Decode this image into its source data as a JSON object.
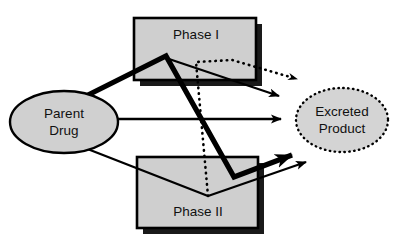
{
  "diagram": {
    "type": "flow-diagram",
    "background_color": "#ffffff",
    "nodes": {
      "parent_drug": {
        "label_line1": "Parent",
        "label_line2": "Drug",
        "shape": "ellipse",
        "fill": "#d0d0d0",
        "border_style": "solid",
        "border_color": "#000000",
        "cx": 64,
        "cy": 122,
        "rx": 54,
        "ry": 31
      },
      "excreted_product": {
        "label_line1": "Excreted",
        "label_line2": "Product",
        "shape": "ellipse",
        "fill": "#d4d4d4",
        "border_style": "dotted",
        "border_color": "#000000",
        "cx": 342,
        "cy": 120,
        "rx": 46,
        "ry": 32
      },
      "phase_one": {
        "label": "Phase I",
        "shape": "rectangle",
        "fill": "#cfcfcf",
        "border_style": "solid",
        "border_color": "#000000",
        "shadow": true,
        "x": 134,
        "y": 18,
        "width": 122,
        "height": 62
      },
      "phase_two": {
        "label": "Phase II",
        "shape": "rectangle",
        "fill": "#cfcfcf",
        "border_style": "solid",
        "border_color": "#000000",
        "shadow": true,
        "x": 137,
        "y": 157,
        "width": 121,
        "height": 71
      }
    },
    "edges": {
      "parent_to_phase1_thick": {
        "name": "parent-drug-to-phase-one",
        "style": "thick-solid",
        "stroke_width": 5,
        "color": "#000000",
        "points": "82,98 165,57"
      },
      "phase1_thick_descent": {
        "name": "phase-one-thick-descent-to-excreted",
        "style": "thick-solid",
        "stroke_width": 5,
        "color": "#000000",
        "points": "165,57 234,177 298,153",
        "arrowhead": "thick-filled"
      },
      "phase1_thin_to_excreted": {
        "name": "phase-one-to-excreted-thin",
        "style": "thin-solid",
        "stroke_width": 2,
        "color": "#000000",
        "points": "166,58 281,97",
        "arrowhead": "thin-filled"
      },
      "parent_direct_to_excreted": {
        "name": "parent-drug-direct-to-excreted",
        "style": "thin-solid",
        "stroke_width": 2,
        "color": "#000000",
        "points": "100,119 283,119",
        "arrowhead": "thin-filled"
      },
      "parent_to_phase2": {
        "name": "parent-drug-to-phase-two",
        "style": "thin-solid",
        "stroke_width": 2,
        "color": "#000000",
        "points": "85,148 208,196"
      },
      "phase2_to_excreted": {
        "name": "phase-two-to-excreted",
        "style": "thin-solid",
        "stroke_width": 2,
        "color": "#000000",
        "points": "208,196 308,161",
        "arrowhead": "thin-filled"
      },
      "phase2_to_phase1_dotted": {
        "name": "phase-two-to-phase-one-dotted",
        "style": "dotted",
        "stroke_width": 2.6,
        "color": "#000000",
        "points": "208,196 196,62 232,60 297,79",
        "arrowhead": "dotted-small"
      }
    }
  }
}
